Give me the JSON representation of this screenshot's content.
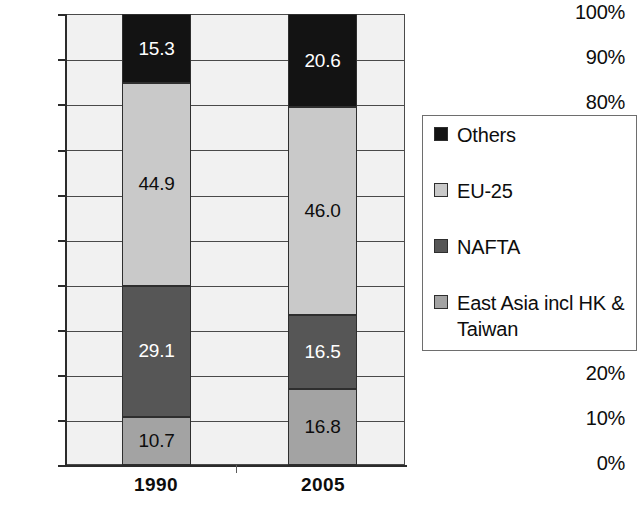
{
  "chart_data": {
    "type": "bar",
    "subtype": "stacked-100-percent",
    "title": "",
    "xlabel": "",
    "ylabel": "",
    "categories": [
      "1990",
      "2005"
    ],
    "ylim": [
      0,
      100
    ],
    "ytick_labels": [
      "0%",
      "10%",
      "20%",
      "30%",
      "40%",
      "50%",
      "60%",
      "70%",
      "80%",
      "90%",
      "100%"
    ],
    "ytick_values": [
      0,
      10,
      20,
      30,
      40,
      50,
      60,
      70,
      80,
      90,
      100
    ],
    "grid": true,
    "grid_axis": "y",
    "legend_position": "right",
    "stack_order_bottom_to_top": [
      "East Asia incl HK & Taiwan",
      "NAFTA",
      "EU-25",
      "Others"
    ],
    "series": [
      {
        "name": "East Asia incl HK & Taiwan",
        "color": "#a3a3a3",
        "label_color": "#0d0d0d",
        "values": [
          10.7,
          16.8
        ],
        "value_labels": [
          "10.7",
          "16.8"
        ]
      },
      {
        "name": "NAFTA",
        "color": "#565656",
        "label_color": "#ffffff",
        "values": [
          29.1,
          16.5
        ],
        "value_labels": [
          "29.1",
          "16.5"
        ]
      },
      {
        "name": "EU-25",
        "color": "#c9c9c9",
        "label_color": "#0d0d0d",
        "values": [
          44.9,
          46.0
        ],
        "value_labels": [
          "44.9",
          "46.0"
        ]
      },
      {
        "name": "Others",
        "color": "#131313",
        "label_color": "#ffffff",
        "values": [
          15.3,
          20.6
        ],
        "value_labels": [
          "15.3",
          "20.6"
        ]
      }
    ],
    "legend_entries": [
      {
        "label": "Others",
        "color": "#131313"
      },
      {
        "label": "EU-25",
        "color": "#c9c9c9"
      },
      {
        "label": "NAFTA",
        "color": "#565656"
      },
      {
        "label": "East Asia incl HK & Taiwan",
        "color": "#a3a3a3"
      }
    ],
    "plot_background": "#f1f1f1",
    "axis_color": "#2b2b2b"
  }
}
